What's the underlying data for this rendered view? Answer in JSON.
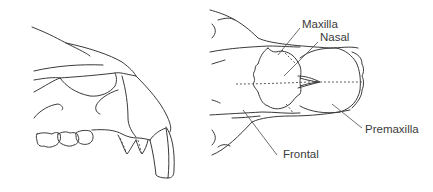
{
  "figure": {
    "left_view": "lateral view of skull (snout)",
    "right_view": "dorsal view of skull (snout)",
    "labels": {
      "maxilla": "Maxilla",
      "nasal": "Nasal",
      "premaxilla": "Premaxilla",
      "frontal": "Frontal"
    }
  }
}
